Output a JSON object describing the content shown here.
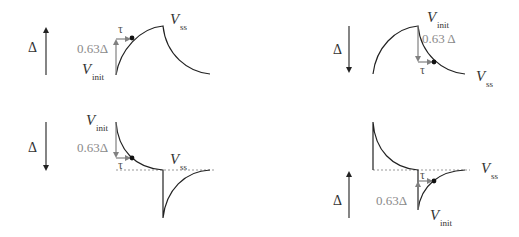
{
  "diagram": {
    "colors": {
      "curve": "#222222",
      "annotation": "#808080",
      "dashed": "#999999",
      "text": "#333333",
      "gray_text": "#8a8a8a"
    },
    "panels": [
      {
        "id": "top-left",
        "delta_label": "Δ",
        "delta_direction": "up",
        "fraction_label": "0.63Δ",
        "tau_label": "τ",
        "v_init": {
          "main": "V",
          "sub": "init"
        },
        "v_ss": {
          "main": "V",
          "sub": "ss"
        }
      },
      {
        "id": "top-right",
        "delta_label": "Δ",
        "delta_direction": "down",
        "fraction_label": "0.63 Δ",
        "tau_label": "τ",
        "v_init": {
          "main": "V",
          "sub": "init"
        },
        "v_ss": {
          "main": "V",
          "sub": "ss"
        }
      },
      {
        "id": "bottom-left",
        "delta_label": "Δ",
        "delta_direction": "down",
        "fraction_label": "0.63Δ",
        "tau_label": "τ",
        "v_init": {
          "main": "V",
          "sub": "init"
        },
        "v_ss": {
          "main": "V",
          "sub": "ss"
        }
      },
      {
        "id": "bottom-right",
        "delta_label": "Δ",
        "delta_direction": "up",
        "fraction_label": "0.63Δ",
        "tau_label": "τ",
        "v_init": {
          "main": "V",
          "sub": "init"
        },
        "v_ss": {
          "main": "V",
          "sub": "ss"
        }
      }
    ]
  }
}
